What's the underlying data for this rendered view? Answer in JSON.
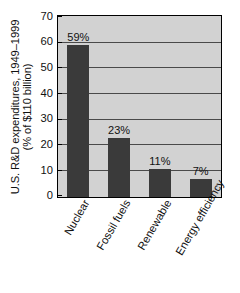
{
  "chart_data": {
    "type": "bar",
    "title": "",
    "subtitle": "",
    "xlabel": "",
    "ylabel_line1": "U.S. R&D expenditures, 1949–1999",
    "ylabel_line2": "(% of $110 billion)",
    "categories": [
      "Nuclear",
      "Fossil fuels",
      "Renewable",
      "Energy efficiency"
    ],
    "values": [
      59,
      23,
      11,
      7
    ],
    "value_labels": [
      "59%",
      "23%",
      "11%",
      "7%"
    ],
    "ylim": [
      0,
      70
    ],
    "ytick_step": 10,
    "ytick_labels": [
      "0",
      "10",
      "20",
      "30",
      "40",
      "50",
      "60",
      "70"
    ],
    "ytick_values": [
      0,
      10,
      20,
      30,
      40,
      50,
      60,
      70
    ],
    "grid": true,
    "grid_orientation": "horizontal",
    "legend": "none",
    "units": "percent",
    "colors": {
      "bar_fill": "#3a3a3a",
      "plot_background": "#d2d2d2",
      "page_background": "#ffffff",
      "axis_line": "#000000",
      "gridline": "#4a4a4a",
      "text": "#111111"
    }
  }
}
